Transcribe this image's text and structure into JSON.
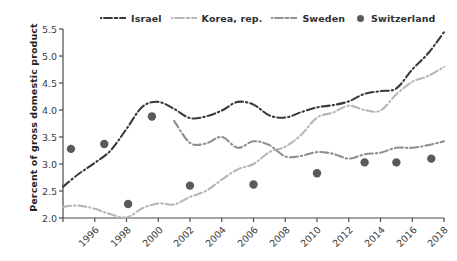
{
  "chart_data": {
    "type": "line",
    "title": "",
    "xlabel": "",
    "ylabel": "Percent of gross domestic product",
    "xlim": [
      1996,
      2020
    ],
    "ylim": [
      2.0,
      5.5
    ],
    "grid": false,
    "legend_position": "top",
    "x_ticks": [
      "1996",
      "1998",
      "2000",
      "2002",
      "2004",
      "2006",
      "2008",
      "2010",
      "2012",
      "2014",
      "2016",
      "2018",
      "2020"
    ],
    "y_ticks": [
      "2.0",
      "2.5",
      "3.0",
      "3.5",
      "4.0",
      "4.5",
      "5.0",
      "5.5"
    ],
    "series": [
      {
        "name": "Israel",
        "style": "dash-dot",
        "color": "#3a3a3a",
        "x": [
          1996,
          1997,
          1998,
          1999,
          2000,
          2001,
          2002,
          2003,
          2004,
          2005,
          2006,
          2007,
          2008,
          2009,
          2010,
          2011,
          2012,
          2013,
          2014,
          2015,
          2016,
          2017,
          2018,
          2019,
          2020
        ],
        "values": [
          2.58,
          2.82,
          3.02,
          3.25,
          3.65,
          4.06,
          4.15,
          4.02,
          3.85,
          3.88,
          3.99,
          4.15,
          4.1,
          3.9,
          3.86,
          3.96,
          4.05,
          4.09,
          4.16,
          4.3,
          4.35,
          4.4,
          4.75,
          5.05,
          5.44
        ]
      },
      {
        "name": "Korea, rep.",
        "style": "dash-dot-light",
        "color": "#b6b6b6",
        "x": [
          1996,
          1997,
          1998,
          1999,
          2000,
          2001,
          2002,
          2003,
          2004,
          2005,
          2006,
          2007,
          2008,
          2009,
          2010,
          2011,
          2012,
          2013,
          2014,
          2015,
          2016,
          2017,
          2018,
          2019,
          2020
        ],
        "values": [
          2.21,
          2.23,
          2.17,
          2.07,
          2.01,
          2.18,
          2.27,
          2.25,
          2.39,
          2.5,
          2.71,
          2.9,
          3.0,
          3.22,
          3.32,
          3.54,
          3.86,
          3.95,
          4.08,
          4.0,
          3.99,
          4.29,
          4.52,
          4.63,
          4.8
        ]
      },
      {
        "name": "Sweden",
        "style": "dash-dot-medium",
        "color": "#8f8f8f",
        "x": [
          2003,
          2004,
          2005,
          2006,
          2007,
          2008,
          2009,
          2010,
          2011,
          2012,
          2013,
          2014,
          2015,
          2016,
          2017,
          2018,
          2019,
          2020
        ],
        "values": [
          3.8,
          3.39,
          3.38,
          3.5,
          3.3,
          3.42,
          3.35,
          3.14,
          3.15,
          3.22,
          3.19,
          3.1,
          3.18,
          3.21,
          3.3,
          3.3,
          3.35,
          3.42
        ]
      }
    ],
    "scatter": [
      {
        "name": "Switzerland",
        "color": "#5a5a5a",
        "marker": "circle",
        "x": [
          1996,
          1999,
          2003,
          2007,
          2011,
          2014,
          2016,
          2018,
          2020
        ],
        "values": [
          3.28,
          3.37,
          2.26,
          3.88,
          2.6,
          2.62,
          2.83,
          3.03,
          3.03,
          3.1
        ]
      }
    ],
    "scatter_points": [
      {
        "x": 1996.5,
        "y": 3.28
      },
      {
        "x": 1998.6,
        "y": 3.37
      },
      {
        "x": 2000.1,
        "y": 2.26
      },
      {
        "x": 2001.6,
        "y": 3.88
      },
      {
        "x": 2004.0,
        "y": 2.6
      },
      {
        "x": 2008.0,
        "y": 2.62
      },
      {
        "x": 2012.0,
        "y": 2.83
      },
      {
        "x": 2015.0,
        "y": 3.03
      },
      {
        "x": 2017.0,
        "y": 3.03
      },
      {
        "x": 2019.2,
        "y": 3.1
      }
    ]
  },
  "legend": {
    "items": [
      {
        "label": "Israel",
        "marker": "dash-dot-line"
      },
      {
        "label": "Korea, rep.",
        "marker": "dash-line-light"
      },
      {
        "label": "Sweden",
        "marker": "dash-dot-line-medium"
      },
      {
        "label": "Switzerland",
        "marker": "filled-circle"
      }
    ]
  },
  "axes": {
    "y_title": "Percent of gross domestic product",
    "y_ticks": [
      "5.5",
      "5.0",
      "4.5",
      "4.0",
      "3.5",
      "3.0",
      "2.5",
      "2.0"
    ],
    "x_ticks": [
      "1996",
      "1998",
      "2000",
      "2002",
      "2004",
      "2006",
      "2008",
      "2010",
      "2012",
      "2014",
      "2016",
      "2018",
      "2020"
    ]
  }
}
